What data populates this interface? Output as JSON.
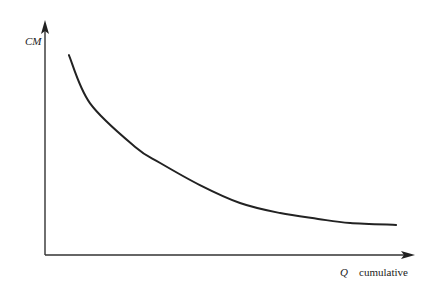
{
  "chart_data": {
    "type": "line",
    "title": "",
    "xlabel": "Q  cumulative",
    "xlabel_symbol": "Q",
    "xlabel_text": "cumulative",
    "ylabel": "CM",
    "xlim": [
      0,
      10
    ],
    "ylim": [
      0,
      10
    ],
    "grid": false,
    "legend": null,
    "ticks": "none",
    "series": [
      {
        "name": "CM vs cumulative Q (decreasing, convex)",
        "color": "#222222",
        "x": [
          0.65,
          1.22,
          2.45,
          3.13,
          4.21,
          5.3,
          6.39,
          7.42,
          8.29,
          9.54
        ],
        "y": [
          8.58,
          6.52,
          4.64,
          3.95,
          3.0,
          2.23,
          1.8,
          1.55,
          1.37,
          1.29
        ]
      }
    ]
  },
  "colors": {
    "axis": "#333333",
    "curve": "#222222",
    "background": "#ffffff"
  }
}
